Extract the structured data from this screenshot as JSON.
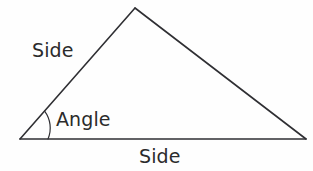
{
  "figure": {
    "background_color": "#fefefe",
    "stroke_color": "#2f2f33",
    "text_color": "#2b2b2b",
    "stroke_width": 1.6,
    "arc_stroke_width": 1.2,
    "shape": "triangle",
    "vertices": {
      "left": {
        "x": 20,
        "y": 139
      },
      "apex": {
        "x": 135,
        "y": 8
      },
      "right": {
        "x": 306,
        "y": 139
      }
    },
    "angle_arc": {
      "center_x": 20,
      "center_y": 139,
      "radius": 28,
      "start_x": 48,
      "start_y": 139,
      "end_x": 44.6,
      "end_y": 111.2,
      "sweep_degrees": 49
    }
  },
  "labels": {
    "side_left": "Side",
    "angle": "Angle",
    "side_base": "Side"
  }
}
